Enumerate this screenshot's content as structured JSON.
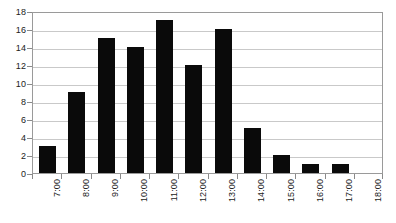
{
  "chart_data": {
    "type": "bar",
    "title": "",
    "subtitle": "",
    "xlabel": "",
    "ylabel": "",
    "categories": [
      "7:00",
      "8:00",
      "9:00",
      "10:00",
      "11:00",
      "12:00",
      "13:00",
      "14:00",
      "15:00",
      "16:00",
      "17:00",
      "18:00"
    ],
    "values": [
      3,
      9,
      15,
      14,
      17,
      12,
      16,
      5,
      2,
      1,
      1,
      0
    ],
    "ylim": [
      0,
      18
    ],
    "y_ticks": [
      0,
      2,
      4,
      6,
      8,
      10,
      12,
      14,
      16,
      18
    ],
    "y_tick_labels": [
      "0",
      "2",
      "4",
      "6",
      "8",
      "10",
      "12",
      "14",
      "16",
      "18"
    ],
    "grid": true,
    "grid_axis": "y",
    "legend": false,
    "legend_position": "none",
    "annotations": [],
    "bar_color": "#0a0a0a",
    "gridline_color": "#c9c9c9",
    "axis_color": "#9a9a9a",
    "background_color": "#ffffff",
    "x_tick_label_rotation": 90
  }
}
